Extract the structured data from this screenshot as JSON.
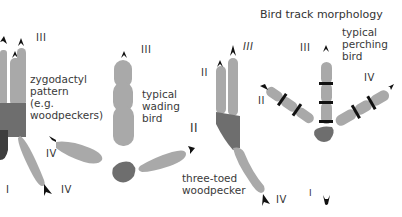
{
  "title": "Bird track morphology",
  "colors": {
    "toe": "#a9a9a9",
    "pad": "#6e6e6e",
    "claw": "#111111",
    "text": "#3a3a3a"
  },
  "tracks": [
    {
      "name": "zygodactyl",
      "label_lines": [
        "zygodactyl",
        "pattern",
        "(e.g.",
        "woodpeckers)"
      ],
      "toe_labels": {
        "III": "III",
        "IV_upper": "IV",
        "IV_lower": "IV",
        "I": "I"
      }
    },
    {
      "name": "wading",
      "label_lines": [
        "typical",
        "wading",
        "bird"
      ],
      "toe_labels": {
        "III": "III",
        "II": "II"
      }
    },
    {
      "name": "three-toed-woodpecker",
      "label_lines": [
        "three-toed",
        "woodpecker"
      ],
      "toe_labels": {
        "III": "III",
        "II": "II",
        "IV": "IV"
      }
    },
    {
      "name": "perching",
      "label_lines": [
        "typical",
        "perching",
        "bird"
      ],
      "toe_labels": {
        "III": "III",
        "II": "II",
        "IV": "IV",
        "I": "I"
      }
    }
  ]
}
